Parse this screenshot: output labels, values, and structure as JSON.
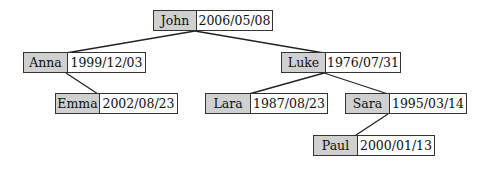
{
  "diagram": {
    "type": "tree",
    "colors": {
      "name_cell": "#d0d0d0",
      "date_cell": "#fdfdfd",
      "border": "#333333"
    },
    "nodes": {
      "john": {
        "name": "John",
        "date": "2006/05/08"
      },
      "anna": {
        "name": "Anna",
        "date": "1999/12/03"
      },
      "emma": {
        "name": "Emma",
        "date": "2002/08/23"
      },
      "luke": {
        "name": "Luke",
        "date": "1976/07/31"
      },
      "lara": {
        "name": "Lara",
        "date": "1987/08/23"
      },
      "sara": {
        "name": "Sara",
        "date": "1995/03/14"
      },
      "paul": {
        "name": "Paul",
        "date": "2000/01/13"
      }
    },
    "edges": [
      [
        "John",
        "Anna"
      ],
      [
        "John",
        "Luke"
      ],
      [
        "Anna",
        "Emma"
      ],
      [
        "Luke",
        "Lara"
      ],
      [
        "Luke",
        "Sara"
      ],
      [
        "Sara",
        "Paul"
      ]
    ]
  }
}
